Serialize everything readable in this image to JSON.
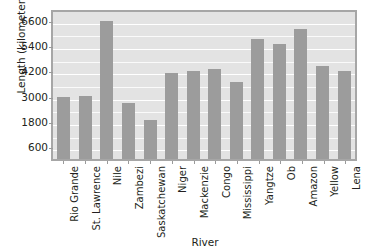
{
  "chart_data": {
    "type": "bar",
    "title": "",
    "xlabel": "River",
    "ylabel": "Length (kilometers)",
    "categories": [
      "Rio Grande",
      "St. Lawrence",
      "Nile",
      "Zambezi",
      "Saskatchewan",
      "Niger",
      "Mackenzie",
      "Congo",
      "Mississippi",
      "Yangtze",
      "Ob",
      "Amazon",
      "Yellow",
      "Lena"
    ],
    "values": [
      3050,
      3060,
      6650,
      2750,
      1940,
      4150,
      4250,
      4350,
      3750,
      5800,
      5550,
      6250,
      4500,
      4250
    ],
    "ylim": [
      0,
      7150
    ],
    "yticks": [
      600,
      1800,
      3000,
      4200,
      5400,
      6600
    ],
    "ytick_labels": [
      "600",
      "1800",
      "3000",
      "4200",
      "5400",
      "6600"
    ],
    "grid": true,
    "grid_minor": true,
    "legend": "none",
    "bar_color": "#9c9c9c",
    "plot_background": "#e3e3e3",
    "axis_color": "#a6a6a6",
    "text_color": "#231f20"
  }
}
